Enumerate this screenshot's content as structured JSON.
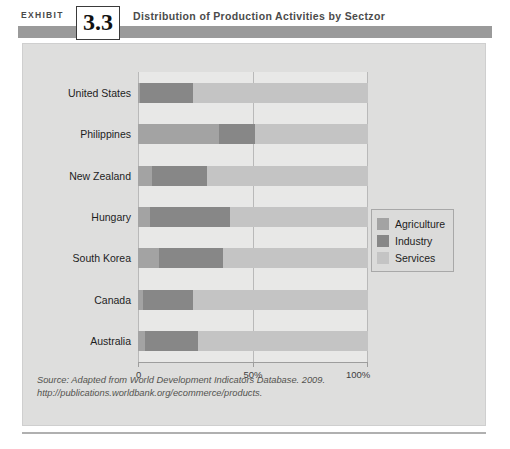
{
  "exhibit": {
    "label": "EXHIBIT",
    "number": "3.3",
    "title": "Distribution of Production Activities by Sectzor"
  },
  "source_note": "Source: Adapted from World Development Indicators Database. 2009. http://publications.worldbank.org/ecommerce/products.",
  "legend": {
    "items": [
      {
        "label": "Agriculture",
        "color": "#a3a3a3"
      },
      {
        "label": "Industry",
        "color": "#878787"
      },
      {
        "label": "Services",
        "color": "#c4c4c4"
      }
    ]
  },
  "axis": {
    "ticks": [
      {
        "label": "0",
        "value": 0
      },
      {
        "label": "50%",
        "value": 50
      },
      {
        "label": "100%",
        "value": 100
      }
    ]
  },
  "chart_data": {
    "type": "bar",
    "orientation": "horizontal",
    "stacked": true,
    "stack_total": 100,
    "title": "Distribution of Production Activities by Sectzor",
    "xlabel": "",
    "ylabel": "",
    "xlim": [
      0,
      100
    ],
    "xtick_labels": [
      "0",
      "50%",
      "100%"
    ],
    "xticks": [
      0,
      50,
      100
    ],
    "grid": true,
    "grid_axis": "x",
    "legend_position": "right",
    "categories": [
      "United States",
      "Philippines",
      "New Zealand",
      "Hungary",
      "South Korea",
      "Canada",
      "Australia"
    ],
    "series": [
      {
        "name": "Agriculture",
        "color": "#a3a3a3",
        "values": [
          1,
          35,
          6,
          5,
          9,
          2,
          3
        ]
      },
      {
        "name": "Industry",
        "color": "#878787",
        "values": [
          23,
          16,
          24,
          35,
          28,
          22,
          23
        ]
      },
      {
        "name": "Services",
        "color": "#c4c4c4",
        "values": [
          76,
          49,
          70,
          60,
          63,
          76,
          74
        ]
      }
    ],
    "annotations": [],
    "source": "Adapted from World Development Indicators Database. 2009. http://publications.worldbank.org/ecommerce/products."
  }
}
